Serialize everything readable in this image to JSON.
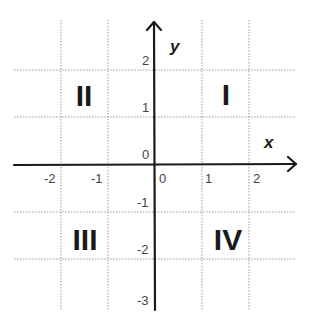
{
  "diagram": {
    "type": "cartesian-coordinate-plane",
    "axes": {
      "x_label": "x",
      "y_label": "y",
      "x_ticks": [
        "-2",
        "-1",
        "0",
        "1",
        "2"
      ],
      "y_ticks": [
        "2",
        "1",
        "0",
        "-1",
        "-2",
        "-3"
      ]
    },
    "quadrants": {
      "q1": "I",
      "q2": "II",
      "q3": "III",
      "q4": "IV"
    },
    "colors": {
      "axis": "#1a1a1a",
      "grid": "#9a9a9a",
      "text": "#444444"
    }
  }
}
